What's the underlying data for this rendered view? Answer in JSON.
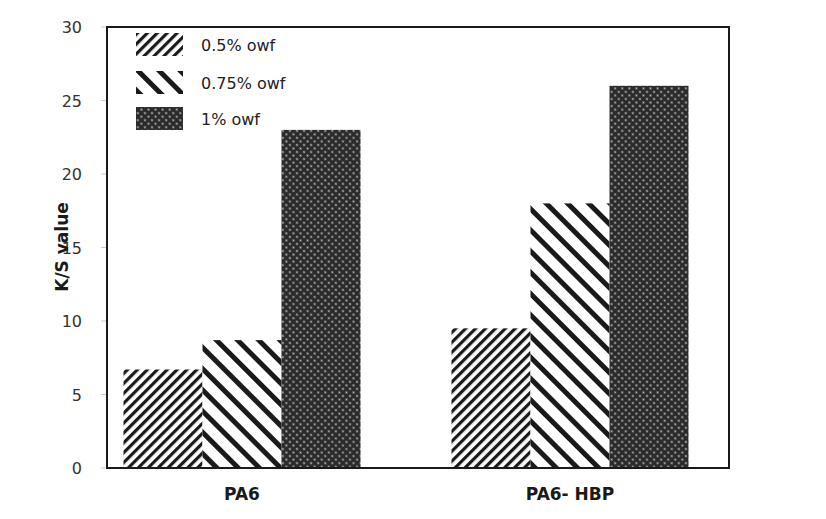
{
  "chart_data": {
    "type": "bar",
    "title": "",
    "xlabel": "",
    "ylabel": "K/S value",
    "ylim": [
      0,
      30
    ],
    "yticks": [
      0,
      5,
      10,
      15,
      20,
      25,
      30
    ],
    "grid": false,
    "legend_position": "upper-left-inside",
    "categories": [
      "PA6",
      "PA6- HBP"
    ],
    "series": [
      {
        "name": "0.5% owf",
        "pattern": "fine-diagonal-hatch",
        "values": [
          6.7,
          9.5
        ]
      },
      {
        "name": "0.75% owf",
        "pattern": "wide-backdiagonal-hatch",
        "values": [
          8.7,
          18.0
        ]
      },
      {
        "name": "1% owf",
        "pattern": "dense-crosshatch",
        "values": [
          23.0,
          26.0
        ]
      }
    ]
  },
  "colors": {
    "ink": "#1a1a1a",
    "background": "#ffffff"
  }
}
